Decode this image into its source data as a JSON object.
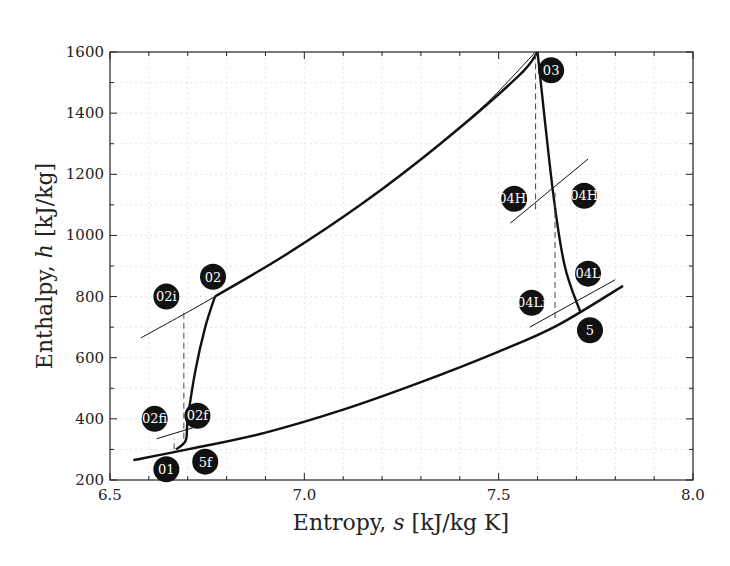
{
  "chart_data": {
    "type": "line",
    "title": "",
    "xlabel": "Entropy, s [kJ/kg K]",
    "xlabel_parts": {
      "pre": "Entropy, ",
      "var": "s",
      "post": " [kJ/kg K]"
    },
    "ylabel": "Enthalpy, h [kJ/kg]",
    "ylabel_parts": {
      "pre": "Enthalpy, ",
      "var": "h",
      "post": " [kJ/kg]"
    },
    "xlim": [
      6.5,
      8.0
    ],
    "ylim": [
      200,
      1600
    ],
    "x_ticks": [
      "6.5",
      "7.0",
      "7.5",
      "8.0"
    ],
    "y_ticks": [
      "200",
      "400",
      "600",
      "800",
      "1000",
      "1200",
      "1400",
      "1600"
    ],
    "grid": true,
    "legend": "none",
    "series": [
      {
        "name": "low-pressure isobar",
        "style": "thick",
        "points": [
          [
            6.56,
            265
          ],
          [
            6.7,
            300
          ],
          [
            6.9,
            355
          ],
          [
            7.1,
            430
          ],
          [
            7.3,
            520
          ],
          [
            7.5,
            620
          ],
          [
            7.65,
            705
          ],
          [
            7.82,
            835
          ]
        ]
      },
      {
        "name": "compression 01-02f-02",
        "style": "thick",
        "points": [
          [
            6.67,
            300
          ],
          [
            6.695,
            330
          ],
          [
            6.7,
            400
          ],
          [
            6.72,
            560
          ],
          [
            6.745,
            700
          ],
          [
            6.77,
            800
          ]
        ]
      },
      {
        "name": "heat addition 02-03 (actual)",
        "style": "thick",
        "points": [
          [
            6.77,
            800
          ],
          [
            6.95,
            935
          ],
          [
            7.15,
            1105
          ],
          [
            7.35,
            1300
          ],
          [
            7.55,
            1520
          ],
          [
            7.6,
            1600
          ]
        ]
      },
      {
        "name": "ideal isobar through 02i",
        "style": "thin",
        "points": [
          [
            6.58,
            665
          ],
          [
            6.77,
            800
          ],
          [
            7.0,
            975
          ],
          [
            7.25,
            1200
          ],
          [
            7.45,
            1410
          ],
          [
            7.595,
            1600
          ]
        ]
      },
      {
        "name": "expansion 03-5",
        "style": "thick",
        "points": [
          [
            7.6,
            1600
          ],
          [
            7.64,
            1140
          ],
          [
            7.67,
            900
          ],
          [
            7.71,
            750
          ]
        ]
      },
      {
        "name": "isobar 04H",
        "style": "thin",
        "points": [
          [
            7.53,
            1040
          ],
          [
            7.73,
            1250
          ]
        ]
      },
      {
        "name": "isobar 04L",
        "style": "thin",
        "points": [
          [
            7.58,
            700
          ],
          [
            7.8,
            855
          ]
        ]
      },
      {
        "name": "isobar 02fi",
        "style": "thin",
        "points": [
          [
            6.62,
            335
          ],
          [
            6.75,
            385
          ]
        ]
      },
      {
        "name": "isentropic 02i",
        "style": "dashed",
        "points": [
          [
            6.69,
            335
          ],
          [
            6.69,
            750
          ]
        ]
      },
      {
        "name": "isentropic 04Hi",
        "style": "dashed",
        "points": [
          [
            7.595,
            1085
          ],
          [
            7.595,
            1600
          ]
        ]
      },
      {
        "name": "isentropic 04Li",
        "style": "dashed",
        "points": [
          [
            7.645,
            730
          ],
          [
            7.645,
            1140
          ]
        ]
      },
      {
        "name": "isentropic 02fi",
        "style": "dashed",
        "points": [
          [
            6.665,
            300
          ],
          [
            6.665,
            335
          ]
        ]
      }
    ],
    "state_points": [
      {
        "label": "01",
        "s": 6.645,
        "h": 235
      },
      {
        "label": "02fi",
        "s": 6.615,
        "h": 400
      },
      {
        "label": "02f",
        "s": 6.725,
        "h": 410
      },
      {
        "label": "5f",
        "s": 6.745,
        "h": 260
      },
      {
        "label": "02i",
        "s": 6.645,
        "h": 800
      },
      {
        "label": "02",
        "s": 6.765,
        "h": 865
      },
      {
        "label": "03",
        "s": 7.635,
        "h": 1540
      },
      {
        "label": "04Hi",
        "s": 7.54,
        "h": 1120
      },
      {
        "label": "04H",
        "s": 7.72,
        "h": 1130
      },
      {
        "label": "04L",
        "s": 7.73,
        "h": 875
      },
      {
        "label": "04Li",
        "s": 7.585,
        "h": 780
      },
      {
        "label": "5",
        "s": 7.735,
        "h": 690
      }
    ]
  }
}
